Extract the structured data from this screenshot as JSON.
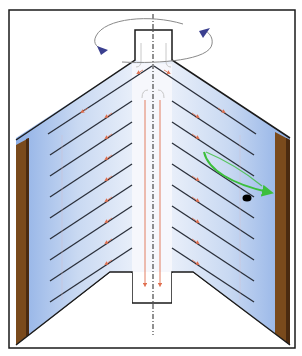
{
  "diagram": {
    "type": "disc-stack-centrifuge-cross-section",
    "colors": {
      "background": "#ffffff",
      "frame": "#1a1a1a",
      "liquid_light": "#eef3fb",
      "liquid_dark": "#8fb0e6",
      "bowl_wall": "#7a4a1c",
      "bowl_wall_dark": "#4a2a10",
      "disc_line": "#2a2f3a",
      "flow_arrow": "#e07050",
      "rotation_arrow": "#3a3f8f",
      "rotation_path": "#8a8a8a",
      "particle_path": "#3cbf3c",
      "particle": "#000000",
      "axis": "#222222"
    },
    "components": {
      "frame": "outer-frame",
      "inlet_tube": "top-inlet",
      "axis": "rotation-axis",
      "disc_stack_left": 8,
      "disc_stack_right": 8,
      "bowl_walls": [
        "left",
        "right"
      ],
      "outlet_box": "bottom-outlet",
      "rotation_indicator": "curved-arrow",
      "particle_trajectory": "green-arrow",
      "particle": "black-dot"
    }
  }
}
